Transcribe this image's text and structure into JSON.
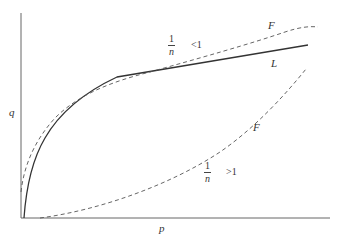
{
  "diagram": {
    "axes": {
      "x_label": "p",
      "y_label": "q"
    },
    "curves": [
      {
        "name": "L",
        "label": "L",
        "style": "solid"
      },
      {
        "name": "F_concave",
        "label": "F",
        "style": "dashed",
        "condition": {
          "fraction_num": "1",
          "fraction_den": "n",
          "relation": "<1"
        }
      },
      {
        "name": "F_convex",
        "label": "F",
        "style": "dashed",
        "condition": {
          "fraction_num": "1",
          "fraction_den": "n",
          "relation": ">1"
        }
      }
    ],
    "colors": {
      "line": "#333333",
      "background": "#ffffff"
    }
  }
}
